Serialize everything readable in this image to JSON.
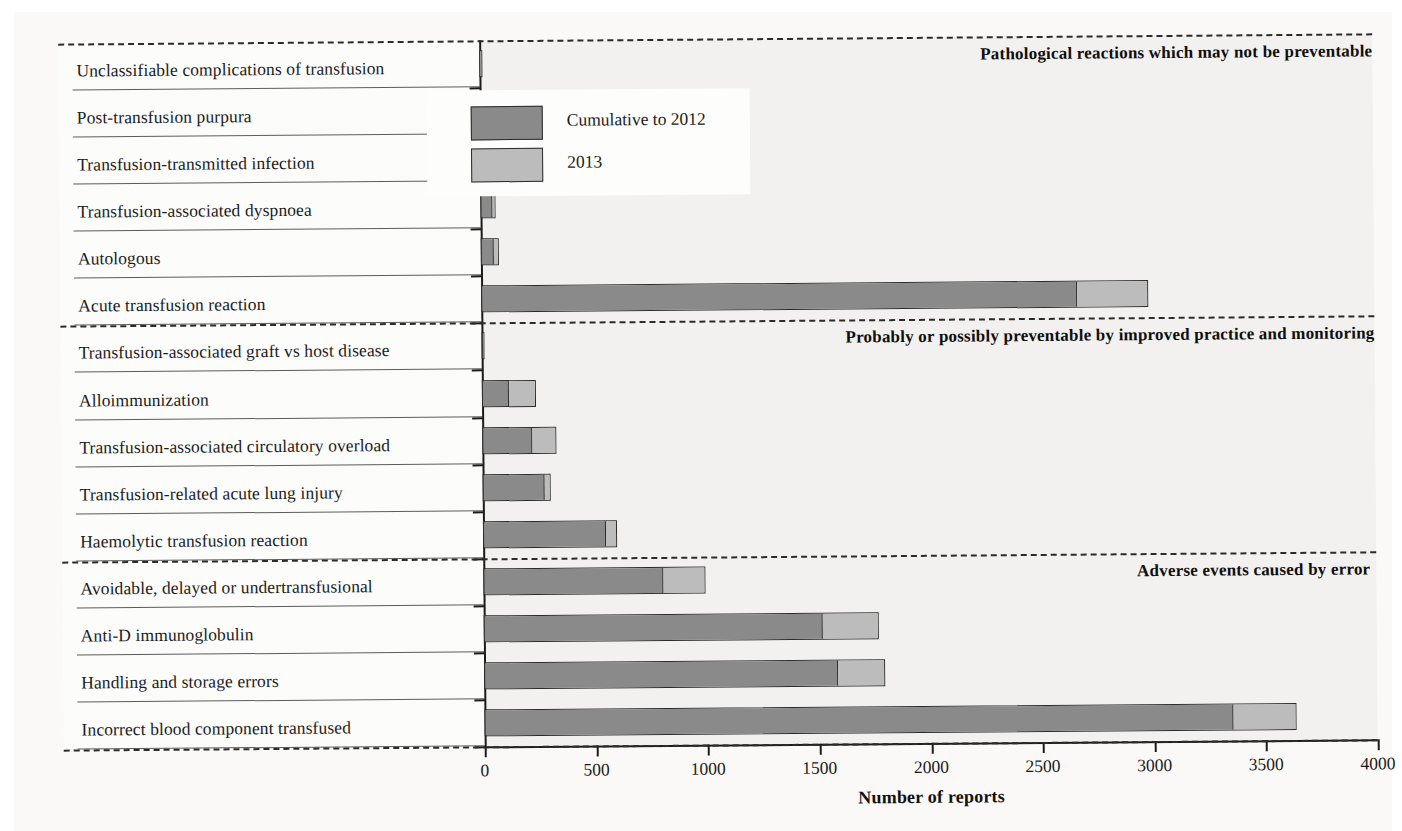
{
  "chart_data": {
    "type": "bar",
    "orientation": "horizontal",
    "stacked": true,
    "title": "",
    "xlabel": "Number of reports",
    "ylabel": "",
    "xlim": [
      0,
      4000
    ],
    "xticks": [
      0,
      500,
      1000,
      1500,
      2000,
      2500,
      3000,
      3500,
      4000
    ],
    "xtick_labels": [
      "0",
      "500",
      "1000",
      "1500",
      "2000",
      "2500",
      "3000",
      "3500",
      "4000"
    ],
    "grid": false,
    "legend_position": "top-right",
    "categories": [
      "Unclassifiable complications of transfusion",
      "Post-transfusion purpura",
      "Transfusion-transmitted infection",
      "Transfusion-associated dyspnoea",
      "Autologous",
      "Acute transfusion reaction",
      "Transfusion-associated graft vs host disease",
      "Alloimmunization",
      "Transfusion-associated circulatory overload",
      "Transfusion-related acute lung injury",
      "Haemolytic transfusion reaction",
      "Avoidable, delayed or undertransfusional",
      "Anti-D immunoglobulin",
      "Handling and storage errors",
      "Incorrect blood component transfused"
    ],
    "series": [
      {
        "name": "Cumulative to 2012",
        "color": "#8a8a8a",
        "values": [
          3,
          20,
          40,
          55,
          62,
          2675,
          13,
          120,
          225,
          280,
          553,
          808,
          1520,
          1590,
          3360
        ]
      },
      {
        "name": "2013",
        "color": "#bcbcbc",
        "values": [
          8,
          5,
          3,
          12,
          18,
          311,
          1,
          120,
          107,
          25,
          45,
          187,
          251,
          205,
          275
        ]
      }
    ],
    "totals": [
      11,
      25,
      43,
      67,
      80,
      2986,
      14,
      240,
      332,
      305,
      598,
      995,
      1771,
      1795,
      3635
    ],
    "annotations": [
      {
        "text": "Pathological reactions which may not be preventable",
        "group_categories": [
          "Unclassifiable complications of transfusion",
          "Post-transfusion purpura",
          "Transfusion-transmitted infection",
          "Transfusion-associated dyspnoea",
          "Autologous",
          "Acute transfusion reaction"
        ]
      },
      {
        "text": "Probably or possibly preventable by improved practice and monitoring",
        "group_categories": [
          "Transfusion-associated graft vs host disease",
          "Alloimmunization",
          "Transfusion-associated circulatory overload",
          "Transfusion-related acute lung injury",
          "Haemolytic transfusion reaction"
        ]
      },
      {
        "text": "Adverse events caused by error",
        "group_categories": [
          "Avoidable, delayed or undertransfusional",
          "Anti-D immunoglobulin",
          "Handling and storage errors",
          "Incorrect blood component transfused"
        ]
      }
    ]
  },
  "legend": {
    "items": [
      {
        "label": "Cumulative to 2012",
        "color": "#8a8a8a"
      },
      {
        "label": "2013",
        "color": "#bcbcbc"
      }
    ]
  },
  "axis": {
    "x_title": "Number of reports"
  }
}
